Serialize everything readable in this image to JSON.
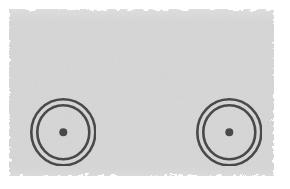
{
  "image": {
    "kind": "scanned-diagram",
    "width": 290,
    "height": 189,
    "page_background": "#ffffff",
    "field_background": "#d7d8d7",
    "ink_color": "#4a4a4a",
    "caption": ""
  },
  "field": {
    "name": "scanned-paper-field",
    "x": 9,
    "y": 9,
    "width": 265,
    "height": 167,
    "edge_style": "ragged-grainy"
  },
  "symbols": [
    {
      "id": "target-left",
      "label": "concentric-ring-target",
      "center_x": 63,
      "center_y": 132,
      "outer_rx": 32,
      "outer_ry": 33,
      "inner_rx": 26,
      "inner_ry": 27,
      "dot_r": 4,
      "stroke_width": 2.6,
      "stroke_color": "#4a4a4a",
      "fill": "none",
      "rings": 2
    },
    {
      "id": "target-right",
      "label": "concentric-ring-target",
      "center_x": 229,
      "center_y": 132,
      "outer_rx": 32,
      "outer_ry": 33,
      "inner_rx": 26,
      "inner_ry": 27,
      "dot_r": 4,
      "stroke_width": 2.6,
      "stroke_color": "#4a4a4a",
      "fill": "none",
      "rings": 2
    }
  ]
}
